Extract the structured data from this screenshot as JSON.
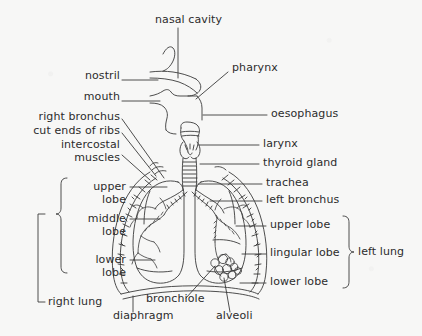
{
  "diagram": {
    "type": "labelled-anatomical-diagram",
    "background_color": "#f7f7f6",
    "ink_color": "#2c2c2c",
    "labels_left": [
      {
        "id": "nostril",
        "text": "nostril",
        "x": 118,
        "y": 76,
        "leader": "horizontal"
      },
      {
        "id": "mouth",
        "text": "mouth",
        "x": 118,
        "y": 97,
        "leader": "horizontal"
      },
      {
        "id": "right-bronchus",
        "text": "right bronchus",
        "x": 118,
        "y": 117,
        "leader": "diagonal"
      },
      {
        "id": "cut-ends-of-ribs",
        "text": "cut ends of ribs",
        "x": 118,
        "y": 131,
        "leader": "diagonal"
      },
      {
        "id": "intercostal-muscles",
        "text": "intercostal\nmuscles",
        "x": 118,
        "y": 145,
        "leader": "diagonal"
      },
      {
        "id": "upper-lobe-right",
        "text": "upper\nlobe",
        "x": 93,
        "y": 183,
        "leader": "horizontal"
      },
      {
        "id": "middle-lobe-right",
        "text": "middle\nlobe",
        "x": 93,
        "y": 215,
        "leader": "horizontal"
      },
      {
        "id": "lower-lobe-right",
        "text": "lower\nlobe",
        "x": 93,
        "y": 256,
        "leader": "horizontal"
      },
      {
        "id": "right-lung",
        "text": "right lung",
        "x": 36,
        "y": 300,
        "leader": "bracket"
      }
    ],
    "labels_top": [
      {
        "id": "nasal-cavity",
        "text": "nasal cavity",
        "x": 155,
        "y": 18,
        "leader": "vertical"
      }
    ],
    "labels_bottom": [
      {
        "id": "diaphragm",
        "text": "diaphragm",
        "x": 113,
        "y": 316,
        "leader": "vertical"
      },
      {
        "id": "bronchiole",
        "text": "bronchiole",
        "x": 146,
        "y": 300,
        "leader": "diagonal"
      },
      {
        "id": "alveoli",
        "text": "alveoli",
        "x": 216,
        "y": 316,
        "leader": "diagonal"
      }
    ],
    "labels_right": [
      {
        "id": "pharynx",
        "text": "pharynx",
        "x": 232,
        "y": 66,
        "leader": "diagonal"
      },
      {
        "id": "oesophagus",
        "text": "oesophagus",
        "x": 271,
        "y": 111,
        "leader": "horizontal"
      },
      {
        "id": "larynx",
        "text": "larynx",
        "x": 263,
        "y": 141,
        "leader": "horizontal"
      },
      {
        "id": "thyroid-gland",
        "text": "thyroid gland",
        "x": 263,
        "y": 160,
        "leader": "horizontal"
      },
      {
        "id": "trachea",
        "text": "trachea",
        "x": 266,
        "y": 180,
        "leader": "horizontal"
      },
      {
        "id": "left-bronchus",
        "text": "left bronchus",
        "x": 266,
        "y": 197,
        "leader": "horizontal"
      },
      {
        "id": "upper-lobe-left",
        "text": "upper lobe",
        "x": 270,
        "y": 222,
        "leader": "horizontal"
      },
      {
        "id": "lingular-lobe",
        "text": "lingular lobe",
        "x": 270,
        "y": 250,
        "leader": "horizontal"
      },
      {
        "id": "lower-lobe-left",
        "text": "lower lobe",
        "x": 270,
        "y": 279,
        "leader": "horizontal"
      },
      {
        "id": "left-lung",
        "text": "left lung",
        "x": 361,
        "y": 251,
        "leader": "brace"
      }
    ],
    "braces": [
      {
        "id": "right-lobes-brace",
        "side": "left",
        "groups": [
          "upper lobe",
          "middle lobe",
          "lower lobe"
        ]
      },
      {
        "id": "right-lung-bracket",
        "side": "left",
        "label": "right lung"
      },
      {
        "id": "left-lung-brace",
        "side": "right",
        "label": "left lung",
        "groups": [
          "upper lobe",
          "lingular lobe",
          "lower lobe"
        ]
      }
    ],
    "structures": [
      "nasal cavity",
      "nostril",
      "mouth",
      "pharynx",
      "oesophagus",
      "larynx",
      "thyroid gland",
      "trachea",
      "right bronchus",
      "left bronchus",
      "bronchiole",
      "alveoli",
      "diaphragm",
      "ribs",
      "intercostal muscles",
      "right lung (upper, middle, lower lobes)",
      "left lung (upper, lingular, lower lobes)"
    ]
  }
}
